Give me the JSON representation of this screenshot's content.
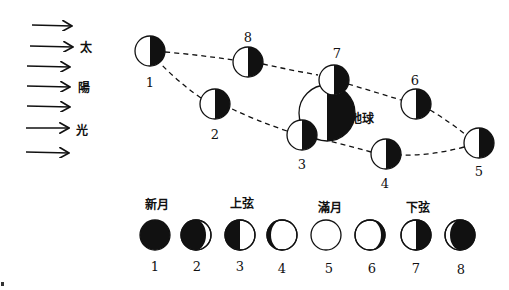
{
  "sunlight": {
    "arrow_count": 7,
    "label_chars": [
      "太",
      "陽",
      "光"
    ]
  },
  "earth": {
    "label": "地球"
  },
  "orbit_positions": [
    {
      "number": "1"
    },
    {
      "number": "2"
    },
    {
      "number": "3"
    },
    {
      "number": "4"
    },
    {
      "number": "5"
    },
    {
      "number": "6"
    },
    {
      "number": "7"
    },
    {
      "number": "8"
    }
  ],
  "phases": {
    "names": {
      "new_moon": "新月",
      "first_quarter": "上弦",
      "full_moon": "滿月",
      "last_quarter": "下弦"
    },
    "items": [
      {
        "number": "1",
        "phase": "new moon"
      },
      {
        "number": "2",
        "phase": "waxing crescent"
      },
      {
        "number": "3",
        "phase": "first quarter"
      },
      {
        "number": "4",
        "phase": "waxing gibbous"
      },
      {
        "number": "5",
        "phase": "full moon"
      },
      {
        "number": "6",
        "phase": "waning gibbous"
      },
      {
        "number": "7",
        "phase": "last quarter"
      },
      {
        "number": "8",
        "phase": "waning crescent"
      }
    ]
  },
  "colors": {
    "ink": "#111111",
    "paper": "#ffffff"
  }
}
